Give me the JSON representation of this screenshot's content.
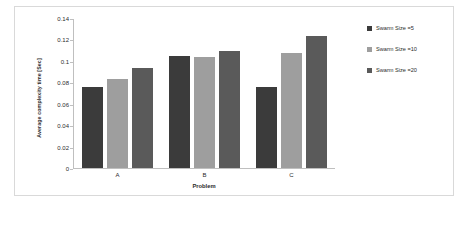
{
  "chart_data": {
    "type": "bar",
    "title": "",
    "xlabel": "Problem",
    "ylabel": "Average complexity time  [Sec]",
    "categories": [
      "A",
      "B",
      "C"
    ],
    "ylim": [
      0,
      0.14
    ],
    "yticks": [
      "0",
      "0.02",
      "0.04",
      "0.06",
      "0.08",
      "0.1",
      "0.12",
      "0.14"
    ],
    "ytick_values": [
      0,
      0.02,
      0.04,
      0.06,
      0.08,
      0.1,
      0.12,
      0.14
    ],
    "grid": false,
    "legend_position": "right",
    "series": [
      {
        "name": "Swarm Size =5",
        "color": "#3b3b3b",
        "values": [
          0.076,
          0.105,
          0.076
        ]
      },
      {
        "name": "Swarm Size =10",
        "color": "#9e9e9e",
        "values": [
          0.084,
          0.104,
          0.108
        ]
      },
      {
        "name": "Swarm Size =20",
        "color": "#5a5a5a",
        "values": [
          0.094,
          0.11,
          0.124
        ]
      }
    ]
  },
  "legend": {
    "items": [
      {
        "label": "Swarm Size =5",
        "color": "#3b3b3b"
      },
      {
        "label": "Swarm Size =10",
        "color": "#9e9e9e"
      },
      {
        "label": "Swarm Size =20",
        "color": "#5a5a5a"
      }
    ]
  }
}
